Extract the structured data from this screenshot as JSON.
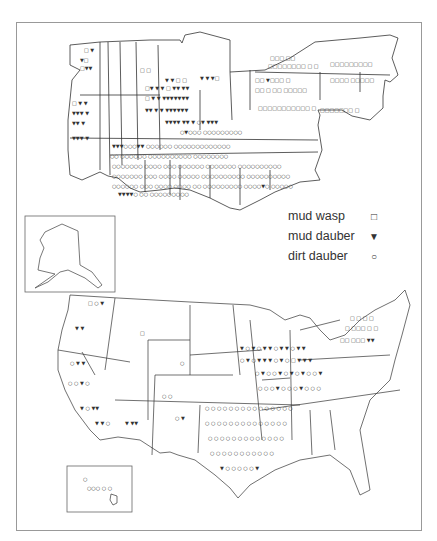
{
  "figure": {
    "top_map": "grid map (dialect survey, eastern states)",
    "bottom_map": "United States map with inset Alaska and Hawaii"
  },
  "legend": {
    "items": [
      {
        "label": "mud wasp",
        "symbol": "□",
        "icon": "square-icon"
      },
      {
        "label": "mud dauber",
        "symbol": "▼",
        "icon": "triangle-down-icon"
      },
      {
        "label": "dirt dauber",
        "symbol": "○",
        "icon": "circle-icon"
      }
    ]
  },
  "colors": {
    "line": "#333333",
    "frame": "#999999",
    "background": "#ffffff"
  }
}
